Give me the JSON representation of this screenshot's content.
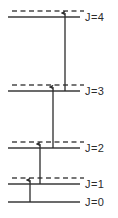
{
  "diagram": {
    "type": "energy-level-diagram",
    "title": "",
    "colors": {
      "line": "#3a3a3a",
      "dashed": "#4a4a4a",
      "arrow": "#2b2b2b",
      "text": "#2b2b2b",
      "background": "#ffffff"
    },
    "levels": [
      {
        "id": "level-j4",
        "label": "J=4",
        "quantum_number": 4,
        "solid_y": 17,
        "dashed_y": 11,
        "has_dashed": true,
        "line_x_start": 8,
        "line_x_end": 80,
        "dash_x_start": 12,
        "dash_x_end": 84,
        "label_x": 85
      },
      {
        "id": "level-j3",
        "label": "J=3",
        "quantum_number": 3,
        "solid_y": 91,
        "dashed_y": 85,
        "has_dashed": true,
        "line_x_start": 8,
        "line_x_end": 80,
        "dash_x_start": 12,
        "dash_x_end": 84,
        "label_x": 85
      },
      {
        "id": "level-j2",
        "label": "J=2",
        "quantum_number": 2,
        "solid_y": 148,
        "dashed_y": 142,
        "has_dashed": true,
        "line_x_start": 8,
        "line_x_end": 80,
        "dash_x_start": 12,
        "dash_x_end": 84,
        "label_x": 85
      },
      {
        "id": "level-j1",
        "label": "J=1",
        "quantum_number": 1,
        "solid_y": 184,
        "dashed_y": 178,
        "has_dashed": true,
        "line_x_start": 8,
        "line_x_end": 80,
        "dash_x_start": 12,
        "dash_x_end": 84,
        "label_x": 85
      },
      {
        "id": "level-j0",
        "label": "J=0",
        "quantum_number": 0,
        "solid_y": 202,
        "dashed_y": null,
        "has_dashed": false,
        "line_x_start": 8,
        "line_x_end": 80,
        "dash_x_start": null,
        "dash_x_end": null,
        "label_x": 85
      }
    ],
    "transitions": [
      {
        "id": "transition-0-to-1",
        "from_level": 0,
        "to_level": 1,
        "x": 30,
        "y_start": 202,
        "y_end": 180,
        "direction": "up"
      },
      {
        "id": "transition-1-to-2",
        "from_level": 1,
        "to_level": 2,
        "x": 40,
        "y_start": 184,
        "y_end": 144,
        "direction": "up"
      },
      {
        "id": "transition-2-to-3",
        "from_level": 2,
        "to_level": 3,
        "x": 53,
        "y_start": 148,
        "y_end": 87,
        "direction": "up"
      },
      {
        "id": "transition-3-to-4",
        "from_level": 3,
        "to_level": 4,
        "x": 65,
        "y_start": 91,
        "y_end": 13,
        "direction": "up"
      }
    ]
  }
}
